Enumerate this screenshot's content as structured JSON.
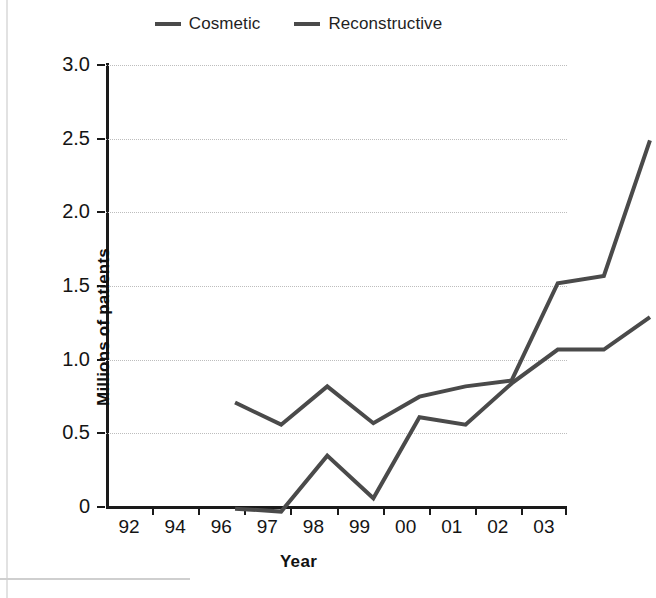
{
  "chart_data": {
    "type": "line",
    "title": "",
    "xlabel": "Year",
    "ylabel": "Millions of patients",
    "categories": [
      "92",
      "94",
      "96",
      "97",
      "98",
      "99",
      "00",
      "01",
      "02",
      "03"
    ],
    "series": [
      {
        "name": "Cosmetic",
        "color": "#4a4a4a",
        "values": [
          1.15,
          1.0,
          1.26,
          1.01,
          1.19,
          1.26,
          1.3,
          1.96,
          2.01,
          2.93
        ]
      },
      {
        "name": "Reconstructive",
        "color": "#4a4a4a",
        "values": [
          0.43,
          0.41,
          0.79,
          0.5,
          1.05,
          1.0,
          1.28,
          1.51,
          1.51,
          1.73
        ]
      }
    ],
    "ylim": [
      0,
      3.0
    ],
    "yticks": [
      0,
      0.5,
      1.0,
      1.5,
      2.0,
      2.5,
      3.0
    ],
    "ytick_labels": [
      "0",
      "0.5",
      "1.0",
      "1.5",
      "2.0",
      "2.5",
      "3.0"
    ],
    "grid": "horizontal-dotted",
    "legend_position": "top-center",
    "legend_entries": [
      "Cosmetic",
      "Reconstructive"
    ]
  },
  "axis": {
    "x_title": "Year",
    "y_title": "Millions of patients"
  },
  "legend": {
    "items": [
      {
        "label": "Cosmetic",
        "marker": "line-dash-marker"
      },
      {
        "label": "Reconstructive",
        "marker": "line-dash-marker"
      }
    ]
  },
  "colors": {
    "series_line": "#4a4a4a",
    "axis": "#1a1a1a",
    "grid": "#bdbdbd",
    "background": "#ffffff"
  }
}
